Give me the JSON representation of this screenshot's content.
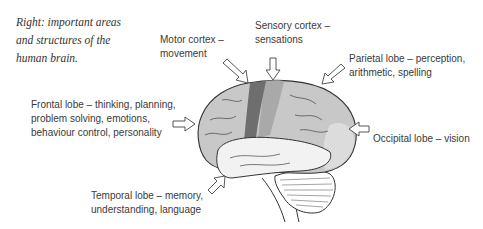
{
  "caption": {
    "lines": [
      "Right: important areas",
      "and structures of the",
      "human brain."
    ]
  },
  "labels": {
    "motor": [
      "Motor cortex –",
      "movement"
    ],
    "sensory": [
      "Sensory cortex –",
      "sensations"
    ],
    "parietal": [
      "Parietal lobe – perception,",
      "arithmetic, spelling"
    ],
    "frontal": [
      "Frontal lobe – thinking, planning,",
      "problem solving, emotions,",
      "behaviour control, personality"
    ],
    "occipital": [
      "Occipital lobe – vision"
    ],
    "temporal": [
      "Temporal lobe – memory,",
      "understanding, language"
    ]
  },
  "colors": {
    "motor_cortex": "#6e6e6e",
    "sensory_cortex": "#a9a9a9",
    "cerebrum": "#c8c8c8",
    "temporal_lobe": "#f2f2f2",
    "outline": "#333333"
  }
}
